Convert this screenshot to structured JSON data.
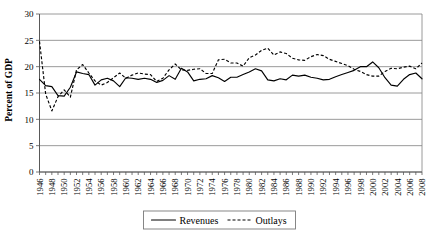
{
  "chart_data": {
    "type": "line",
    "title": "",
    "xlabel": "",
    "ylabel": "Percent of GDP",
    "ylim": [
      0,
      30
    ],
    "ytick_values": [
      0,
      5,
      10,
      15,
      20,
      25,
      30
    ],
    "ytick_labels": [
      "0",
      "5",
      "10",
      "15",
      "20",
      "25",
      "30"
    ],
    "grid": true,
    "grid_axis": "y",
    "legend_position": "bottom",
    "xlim": [
      1946,
      2008
    ],
    "x": [
      1946,
      1947,
      1948,
      1949,
      1950,
      1951,
      1952,
      1953,
      1954,
      1955,
      1956,
      1957,
      1958,
      1959,
      1960,
      1961,
      1962,
      1963,
      1964,
      1965,
      1966,
      1967,
      1968,
      1969,
      1970,
      1971,
      1972,
      1973,
      1974,
      1975,
      1976,
      1977,
      1978,
      1979,
      1980,
      1981,
      1982,
      1983,
      1984,
      1985,
      1986,
      1987,
      1988,
      1989,
      1990,
      1991,
      1992,
      1993,
      1994,
      1995,
      1996,
      1997,
      1998,
      1999,
      2000,
      2001,
      2002,
      2003,
      2004,
      2005,
      2006,
      2007,
      2008
    ],
    "xtick_labels": [
      "1946",
      "1948",
      "1950",
      "1952",
      "1954",
      "1956",
      "1958",
      "1960",
      "1962",
      "1964",
      "1966",
      "1968",
      "1970",
      "1972",
      "1974",
      "1976",
      "1978",
      "1980",
      "1982",
      "1984",
      "1986",
      "1988",
      "1990",
      "1992",
      "1994",
      "1996",
      "1998",
      "2000",
      "2002",
      "2004",
      "2006",
      "2008"
    ],
    "xtick_step": 2,
    "series": [
      {
        "name": "Revenues",
        "style": "solid",
        "color": "#000000",
        "values": [
          17.6,
          16.4,
          16.2,
          14.5,
          14.4,
          16.1,
          19.0,
          18.7,
          18.5,
          16.5,
          17.5,
          17.8,
          17.3,
          16.2,
          17.9,
          17.8,
          17.6,
          17.8,
          17.6,
          17.0,
          17.4,
          18.3,
          17.6,
          19.7,
          19.0,
          17.3,
          17.6,
          17.7,
          18.3,
          17.9,
          17.2,
          18.0,
          18.0,
          18.5,
          19.0,
          19.6,
          19.2,
          17.5,
          17.3,
          17.7,
          17.5,
          18.4,
          18.2,
          18.4,
          18.0,
          17.8,
          17.5,
          17.6,
          18.1,
          18.5,
          18.9,
          19.3,
          20.0,
          20.0,
          20.9,
          19.8,
          17.9,
          16.5,
          16.3,
          17.6,
          18.5,
          18.8,
          17.7
        ],
        "label_position": "legend"
      },
      {
        "name": "Outlays",
        "style": "dashed",
        "color": "#000000",
        "values": [
          24.8,
          14.8,
          11.6,
          14.3,
          15.6,
          14.2,
          19.4,
          20.4,
          18.8,
          17.3,
          16.5,
          17.0,
          17.9,
          18.8,
          17.8,
          18.4,
          18.8,
          18.6,
          18.5,
          17.2,
          17.8,
          19.4,
          20.5,
          19.4,
          19.3,
          19.5,
          19.6,
          18.7,
          18.7,
          21.3,
          21.4,
          20.7,
          20.7,
          20.1,
          21.7,
          22.2,
          23.1,
          23.5,
          22.2,
          22.8,
          22.5,
          21.6,
          21.3,
          21.2,
          21.9,
          22.3,
          22.1,
          21.4,
          21.0,
          20.6,
          20.2,
          19.5,
          19.1,
          18.5,
          18.2,
          18.2,
          19.1,
          19.7,
          19.6,
          19.9,
          20.1,
          19.6,
          20.7
        ],
        "label_position": "legend"
      }
    ],
    "legend": [
      {
        "label": "Revenues",
        "style": "solid"
      },
      {
        "label": "Outlays",
        "style": "dashed"
      }
    ]
  }
}
